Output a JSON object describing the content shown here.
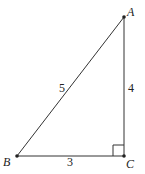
{
  "diagram": {
    "type": "right-triangle",
    "colors": {
      "stroke": "#333333",
      "text": "#222222",
      "background": "#ffffff"
    },
    "vertices": [
      {
        "id": "A",
        "label": "A",
        "x": 124,
        "y": 17,
        "label_x": 127,
        "label_y": 16
      },
      {
        "id": "B",
        "label": "B",
        "x": 17,
        "y": 156,
        "label_x": 3,
        "label_y": 166
      },
      {
        "id": "C",
        "label": "C",
        "x": 124,
        "y": 156,
        "label_x": 126,
        "label_y": 168
      }
    ],
    "sides": [
      {
        "id": "AB",
        "from": "A",
        "to": "B",
        "label": "5",
        "label_x": 59,
        "label_y": 92
      },
      {
        "id": "AC",
        "from": "A",
        "to": "C",
        "label": "4",
        "label_x": 128,
        "label_y": 92
      },
      {
        "id": "BC",
        "from": "B",
        "to": "C",
        "label": "3",
        "label_x": 67,
        "label_y": 166
      }
    ],
    "right_angle": {
      "at": "C",
      "size": 11
    }
  }
}
